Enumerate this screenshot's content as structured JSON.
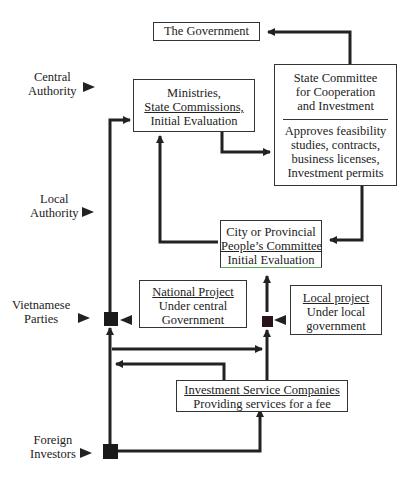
{
  "levels": [
    {
      "id": "central",
      "lines": [
        "Central",
        "Authority"
      ]
    },
    {
      "id": "local",
      "lines": [
        "Local",
        "Authority"
      ]
    },
    {
      "id": "vietnamese",
      "lines": [
        "Vietnamese",
        "Parties"
      ]
    },
    {
      "id": "foreign",
      "lines": [
        "Foreign",
        "Investors"
      ]
    }
  ],
  "boxes": {
    "government": {
      "lines": [
        "The Government"
      ]
    },
    "ministries": {
      "lines": [
        "Ministries,",
        "State Commissions,",
        "Initial Evaluation"
      ]
    },
    "state_committee": {
      "top": [
        "State Committee",
        "for Cooperation",
        "and Investment"
      ],
      "bottom": [
        "Approves feasibility",
        "studies, contracts,",
        "business licenses,",
        "Investment permits"
      ]
    },
    "city_committee": {
      "lines": [
        "City or Provincial",
        "People’s Committee",
        "Initial Evaluation"
      ]
    },
    "national_project": {
      "lines": [
        "National Project",
        "Under central",
        "Government"
      ]
    },
    "local_project": {
      "lines": [
        "Local project",
        "Under local",
        "government"
      ]
    },
    "service_companies": {
      "lines": [
        "Investment Service Companies",
        "Providing services for a fee"
      ]
    }
  }
}
